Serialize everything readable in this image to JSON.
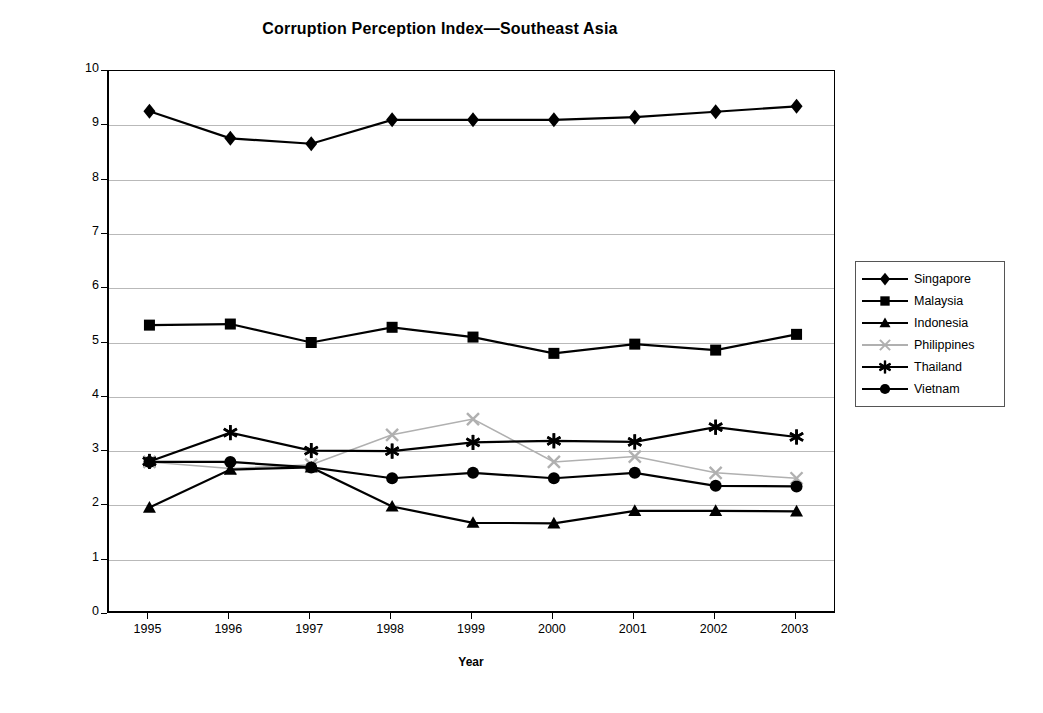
{
  "chart_data": {
    "type": "line",
    "title": "Corruption Perception Index—Southeast Asia",
    "xlabel": "Year",
    "ylabel": "Index- more is better",
    "categories": [
      "1995",
      "1996",
      "1997",
      "1998",
      "1999",
      "2000",
      "2001",
      "2002",
      "2003"
    ],
    "ylim": [
      0,
      10
    ],
    "yticks": [
      "0",
      "1",
      "2",
      "3",
      "4",
      "5",
      "6",
      "7",
      "8",
      "9",
      "10"
    ],
    "grid": true,
    "legend_position": "right",
    "series": [
      {
        "name": "Singapore",
        "marker": "diamond",
        "color": "#000000",
        "values": [
          9.26,
          8.76,
          8.66,
          9.1,
          9.1,
          9.1,
          9.15,
          9.25,
          9.35
        ]
      },
      {
        "name": "Malaysia",
        "marker": "square",
        "color": "#000000",
        "values": [
          5.32,
          5.34,
          5.0,
          5.28,
          5.1,
          4.8,
          4.97,
          4.86,
          5.15
        ]
      },
      {
        "name": "Indonesia",
        "marker": "triangle",
        "color": "#000000",
        "values": [
          1.96,
          2.66,
          2.7,
          1.98,
          1.68,
          1.67,
          1.9,
          1.9,
          1.89
        ]
      },
      {
        "name": "Philippines",
        "marker": "cross",
        "color": "#b0b0b0",
        "values": [
          2.8,
          2.68,
          2.75,
          3.3,
          3.59,
          2.8,
          2.9,
          2.6,
          2.5
        ]
      },
      {
        "name": "Thailand",
        "marker": "star",
        "color": "#000000",
        "values": [
          2.81,
          3.34,
          3.01,
          3.0,
          3.16,
          3.19,
          3.17,
          3.44,
          3.26
        ]
      },
      {
        "name": "Vietnam",
        "marker": "circle",
        "color": "#000000",
        "values": [
          2.8,
          2.8,
          2.7,
          2.5,
          2.6,
          2.5,
          2.6,
          2.36,
          2.35
        ]
      }
    ]
  },
  "legend": {
    "items": [
      {
        "label": "Singapore"
      },
      {
        "label": "Malaysia"
      },
      {
        "label": "Indonesia"
      },
      {
        "label": "Philippines"
      },
      {
        "label": "Thailand"
      },
      {
        "label": "Vietnam"
      }
    ]
  }
}
